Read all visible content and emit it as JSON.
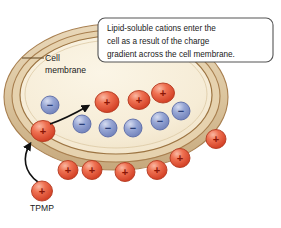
{
  "figure": {
    "title_alt": "Lipid-soluble cation uptake across the cell membrane",
    "background_color": "#ffffff"
  },
  "callout": {
    "lines": [
      "Lipid-soluble cations enter the",
      "cell as a result of the charge",
      "gradient across the cell membrane."
    ],
    "border_color": "#555555",
    "fill_color": "#ffffff"
  },
  "labels": {
    "membrane": {
      "line1": "Cell",
      "line2": "membrane"
    },
    "tpmp": "TPMP"
  },
  "colors": {
    "cation_fill": "#e8503a",
    "cation_highlight": "#f4a48a",
    "cation_sign": "#8a1506",
    "anion_fill": "#8f9fd0",
    "anion_highlight": "#c3ccea",
    "anion_sign": "#2b3f77",
    "membrane_outer": "#b08a5e",
    "membrane_band": "#e3cfad",
    "membrane_line": "#9c7442",
    "cytoplasm": "#f7eed8",
    "arrow": "#111111"
  },
  "cell": {
    "outer_ellipse": {
      "cx": 116,
      "cy": 97,
      "rx": 112,
      "ry": 73
    },
    "inner_ellipse": {
      "cx": 116,
      "cy": 95,
      "rx": 96,
      "ry": 59
    }
  },
  "ions": {
    "signs": {
      "positive": "+",
      "negative": "−"
    },
    "inside_cations": [
      {
        "cx": 107,
        "cy": 102,
        "r": 11.5
      },
      {
        "cx": 139,
        "cy": 100,
        "r": 10.5
      },
      {
        "cx": 163,
        "cy": 93,
        "r": 11
      }
    ],
    "inside_anions": [
      {
        "cx": 50,
        "cy": 105,
        "r": 9
      },
      {
        "cx": 82,
        "cy": 124,
        "r": 9
      },
      {
        "cx": 108,
        "cy": 128,
        "r": 9
      },
      {
        "cx": 133,
        "cy": 128,
        "r": 9
      },
      {
        "cx": 160,
        "cy": 121,
        "r": 9
      },
      {
        "cx": 181,
        "cy": 111,
        "r": 9
      }
    ],
    "membrane_cation": {
      "cx": 43,
      "cy": 131,
      "r": 11
    },
    "outside_cations": [
      {
        "cx": 216,
        "cy": 139,
        "r": 9.5
      },
      {
        "cx": 180,
        "cy": 158,
        "r": 9.5
      },
      {
        "cx": 157,
        "cy": 170,
        "r": 9.5
      },
      {
        "cx": 125,
        "cy": 172,
        "r": 9.5
      },
      {
        "cx": 92,
        "cy": 170,
        "r": 9.5
      },
      {
        "cx": 68,
        "cy": 170,
        "r": 9.5
      },
      {
        "cx": 42,
        "cy": 191,
        "r": 10
      }
    ]
  },
  "arrows": {
    "influx_internal": "curved arrow from membrane cation into cytoplasm",
    "tpmp_entry": "curved arrow from TPMP cation up to the membrane"
  }
}
